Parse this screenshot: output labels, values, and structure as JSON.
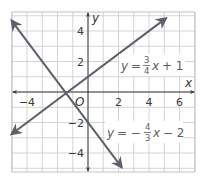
{
  "chart_data": {
    "type": "line",
    "title": "",
    "xlabel": "x",
    "ylabel": "y",
    "origin_label": "O",
    "xlim": [
      -5,
      7
    ],
    "ylim": [
      -5.25,
      5.25
    ],
    "grid": true,
    "x_ticks": [
      {
        "value": -4,
        "label": "−4"
      },
      {
        "value": 2,
        "label": "2"
      },
      {
        "value": 4,
        "label": "4"
      },
      {
        "value": 6,
        "label": "6"
      }
    ],
    "y_ticks": [
      {
        "value": 4,
        "label": "4"
      },
      {
        "value": 2,
        "label": "2"
      },
      {
        "value": -2,
        "label": "−2"
      },
      {
        "value": -4,
        "label": "−4"
      }
    ],
    "series": [
      {
        "name": "y = 3/4 x + 1",
        "slope": 0.75,
        "intercept": 1,
        "x": [
          -5,
          5.1
        ],
        "y": [
          -2.75,
          4.83
        ],
        "label": {
          "y": "y",
          "eq": "=",
          "num": "3",
          "den": "4",
          "x": "x",
          "rest": "+ 1"
        }
      },
      {
        "name": "y = −4/3 x − 2",
        "slope": -1.3333,
        "intercept": -2,
        "x": [
          -5,
          2.2
        ],
        "y": [
          4.67,
          -4.93
        ],
        "label": {
          "y": "y",
          "eq": "= −",
          "num": "4",
          "den": "3",
          "x": "x",
          "rest": "− 2"
        }
      }
    ],
    "intersection": {
      "x": -1.32,
      "y": 0.01
    }
  },
  "colors": {
    "line": "#5b6069",
    "grid": "#c9c9c9",
    "axis": "#3a3a3a",
    "background": "#ffffff"
  }
}
